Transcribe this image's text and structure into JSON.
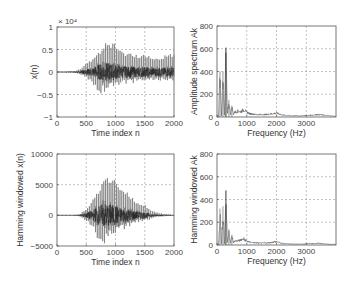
{
  "chart_data": [
    {
      "id": "tl",
      "type": "line",
      "title": "",
      "xlabel": "Time index n",
      "ylabel": "x(n)",
      "y_multiplier_label": "× 10⁴",
      "xlim": [
        0,
        2000
      ],
      "ylim": [
        -1,
        1
      ],
      "xticks": [
        0,
        500,
        1000,
        1500,
        2000
      ],
      "xtick_labels": [
        "0",
        "500",
        "1000",
        "1500",
        "2000"
      ],
      "yticks": [
        -1,
        -0.5,
        0,
        0.5,
        1
      ],
      "ytick_labels": [
        "−1",
        "−0.5",
        "0",
        "0.5",
        "1"
      ],
      "grid": true,
      "box": [
        57,
        27,
        174,
        117
      ],
      "series": [
        {
          "name": "speech signal envelope (×10⁴)",
          "x": [
            0,
            300,
            400,
            500,
            600,
            700,
            800,
            900,
            1000,
            1100,
            1200,
            1300,
            1400,
            1500,
            1600,
            1700,
            1800,
            1900,
            2000
          ],
          "upper": [
            0,
            0.02,
            0.08,
            0.2,
            0.3,
            0.45,
            0.65,
            0.7,
            0.65,
            0.5,
            0.45,
            0.45,
            0.4,
            0.45,
            0.35,
            0.35,
            0.35,
            0.4,
            0.4
          ],
          "lower": [
            0,
            -0.02,
            -0.06,
            -0.15,
            -0.25,
            -0.45,
            -0.5,
            -0.4,
            -0.35,
            -0.3,
            -0.25,
            -0.25,
            -0.2,
            -0.25,
            -0.2,
            -0.2,
            -0.2,
            -0.2,
            -0.2
          ]
        }
      ]
    },
    {
      "id": "tr",
      "type": "line",
      "title": "",
      "xlabel": "Frequency (Hz)",
      "ylabel": "Amplitude spectrum Ak",
      "xlim": [
        0,
        4000
      ],
      "ylim": [
        0,
        800
      ],
      "xticks": [
        0,
        1000,
        2000,
        3000
      ],
      "xtick_labels": [
        "0",
        "1000",
        "2000",
        "3000"
      ],
      "yticks": [
        0,
        200,
        400,
        600,
        800
      ],
      "ytick_labels": [
        "0",
        "200",
        "400",
        "600",
        "800"
      ],
      "grid": true,
      "box": [
        217,
        26,
        336,
        117
      ],
      "series": [
        {
          "name": "Ak",
          "x": [
            0,
            50,
            100,
            150,
            200,
            250,
            300,
            350,
            400,
            450,
            500,
            550,
            600,
            700,
            800,
            900,
            1000,
            1100,
            1200,
            1400,
            1600,
            1800,
            2000,
            2100,
            2200,
            2400,
            2600,
            2800,
            3000,
            3200,
            3400,
            3600,
            3800,
            4000
          ],
          "y": [
            20,
            10,
            400,
            15,
            400,
            20,
            610,
            30,
            150,
            25,
            100,
            30,
            50,
            60,
            55,
            75,
            50,
            35,
            30,
            25,
            25,
            30,
            40,
            30,
            20,
            15,
            12,
            12,
            15,
            20,
            25,
            18,
            12,
            8
          ]
        }
      ]
    },
    {
      "id": "bl",
      "type": "line",
      "title": "",
      "xlabel": "Time index n",
      "ylabel": "Hamming windowed x(n)",
      "xlim": [
        0,
        2000
      ],
      "ylim": [
        -5000,
        10000
      ],
      "xticks": [
        0,
        500,
        1000,
        1500,
        2000
      ],
      "xtick_labels": [
        "0",
        "500",
        "1000",
        "1500",
        "2000"
      ],
      "yticks": [
        -5000,
        0,
        5000,
        10000
      ],
      "ytick_labels": [
        "−5000",
        "0",
        "5000",
        "10000"
      ],
      "grid": true,
      "box": [
        57,
        154,
        174,
        246
      ],
      "series": [
        {
          "name": "windowed envelope",
          "x": [
            0,
            300,
            400,
            500,
            600,
            700,
            800,
            900,
            1000,
            1100,
            1200,
            1300,
            1400,
            1500,
            1600,
            1700,
            1800,
            1900,
            2000
          ],
          "upper": [
            0,
            50,
            300,
            1200,
            2500,
            4500,
            6500,
            6600,
            6000,
            4500,
            3800,
            3000,
            2200,
            1800,
            900,
            500,
            300,
            200,
            100
          ],
          "lower": [
            0,
            -50,
            -250,
            -1000,
            -2000,
            -4200,
            -5000,
            -4000,
            -3200,
            -2500,
            -2000,
            -1500,
            -1200,
            -1000,
            -600,
            -300,
            -200,
            -100,
            -50
          ]
        }
      ]
    },
    {
      "id": "br",
      "type": "line",
      "title": "",
      "xlabel": "Frequency (Hz)",
      "ylabel": "Hamming windowed Ak",
      "xlim": [
        0,
        4000
      ],
      "ylim": [
        0,
        800
      ],
      "xticks": [
        0,
        1000,
        2000,
        3000
      ],
      "xtick_labels": [
        "0",
        "1000",
        "2000",
        "3000"
      ],
      "yticks": [
        0,
        200,
        400,
        600,
        800
      ],
      "ytick_labels": [
        "0",
        "200",
        "400",
        "600",
        "800"
      ],
      "grid": true,
      "box": [
        217,
        154,
        336,
        245
      ],
      "series": [
        {
          "name": "windowed Ak",
          "x": [
            0,
            50,
            100,
            150,
            200,
            250,
            300,
            350,
            400,
            450,
            500,
            550,
            600,
            700,
            800,
            900,
            1000,
            1100,
            1200,
            1400,
            1600,
            1800,
            2000,
            2100,
            2200,
            2400,
            2600,
            2800,
            3000,
            3200,
            3400,
            3600,
            3800,
            4000
          ],
          "y": [
            15,
            8,
            320,
            12,
            340,
            15,
            480,
            25,
            140,
            20,
            90,
            25,
            40,
            45,
            50,
            60,
            40,
            30,
            25,
            20,
            20,
            25,
            35,
            25,
            15,
            12,
            10,
            10,
            12,
            15,
            18,
            12,
            8,
            5
          ]
        }
      ]
    }
  ]
}
